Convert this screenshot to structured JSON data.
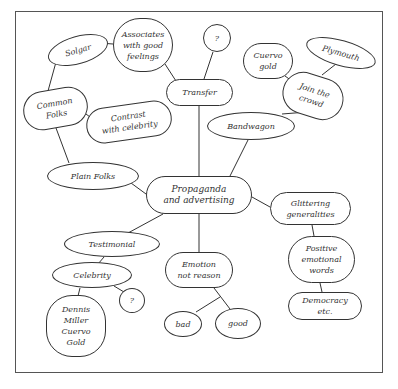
{
  "diagram": {
    "type": "concept-map",
    "central": "Propaganda and advertising",
    "nodes": {
      "center": "Propaganda\nand advertising",
      "transfer": "Transfer",
      "transfer_q": "?",
      "associates": "Associates\nwith good\nfeelings",
      "solgar": "Solgar",
      "bandwagon": "Bandwagon",
      "join_crowd": "Join the\ncrowd",
      "cuervo": "Cuervo\ngold",
      "plymouth": "Plymouth",
      "plain_folks": "Plain Folks",
      "common_folks": "Common\nFolks",
      "contrast": "Contrast\nwith celebrity",
      "glittering": "Glittering\ngeneralities",
      "positive": "Positive\nemotional\nwords",
      "democracy": "Democracy\netc.",
      "testimonial": "Testimonial",
      "celebrity": "Celebrity",
      "celebrity_q": "?",
      "dennis": "Dennis\nMiller\nCuervo\nGold",
      "emotion": "Emotion\nnot reason",
      "bad": "bad",
      "good": "good"
    },
    "edges": [
      [
        "center",
        "transfer"
      ],
      [
        "transfer",
        "transfer_q"
      ],
      [
        "transfer",
        "associates"
      ],
      [
        "associates",
        "solgar"
      ],
      [
        "solgar",
        "common_folks"
      ],
      [
        "center",
        "bandwagon"
      ],
      [
        "bandwagon",
        "join_crowd"
      ],
      [
        "join_crowd",
        "cuervo"
      ],
      [
        "join_crowd",
        "plymouth"
      ],
      [
        "center",
        "plain_folks"
      ],
      [
        "plain_folks",
        "common_folks"
      ],
      [
        "common_folks",
        "contrast"
      ],
      [
        "center",
        "glittering"
      ],
      [
        "glittering",
        "positive"
      ],
      [
        "positive",
        "democracy"
      ],
      [
        "center",
        "testimonial"
      ],
      [
        "testimonial",
        "celebrity"
      ],
      [
        "celebrity",
        "celebrity_q"
      ],
      [
        "celebrity",
        "dennis"
      ],
      [
        "center",
        "emotion"
      ],
      [
        "emotion",
        "bad"
      ],
      [
        "emotion",
        "good"
      ]
    ]
  }
}
